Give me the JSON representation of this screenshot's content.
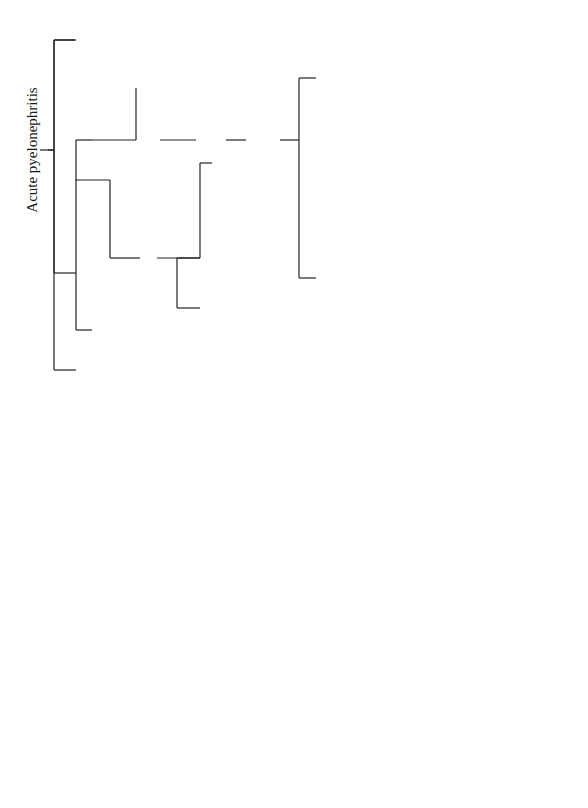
{
  "diagram": {
    "type": "flowchart",
    "orientation": "rotated-90-ccw",
    "title": "Acute pyelonephritis",
    "nodes": {
      "root": "Acute pyelonephritis",
      "uncomplicated": "Uncomplicated",
      "complicated": "Complicated",
      "complicated_criteria": [
        "Hx of structural abnormalities",
        "Hx of resistance to antibiotics",
        "Immunosuppression"
      ],
      "mild_illness": [
        "Mild illness",
        "Tolerating orals"
      ],
      "high_risk": [
        "> 65 yr old",
        "DM",
        "Severe illness",
        "Not taking orals",
        "Sepsis"
      ],
      "severe_sepsis": "Severe illness/sepsis",
      "mild_moderate": [
        "Mild to moderate",
        "illness"
      ],
      "urine_culture_left": "Urine culture",
      "urine_culture_right": "Urine culture",
      "empiric_oral_uncomp": [
        "Empiric Tx",
        "orally for 14 d;",
        "adjust Rx based on",
        "culture results"
      ],
      "empiric_oral_comp": [
        "Empiric treatment",
        "orally for 14 d",
        "(quinolones);",
        "adjust treatment",
        "based on culture",
        "results"
      ],
      "hospitalize": "Hospitalize",
      "urine_blood_culture": "Urine/blood culture",
      "empiric_iv": [
        "Empiric IV antibiotic;",
        "adjust Rx based",
        "on culture results"
      ],
      "response": [
        "Response to Tx",
        "Afebrile after 72 h"
      ],
      "complete_treatment": [
        "Complete treatment",
        "with oral antibiotics",
        "(total = 14 d)"
      ],
      "imaging": [
        "UTZ / CT (R/O",
        "abscess, stone,",
        "obstruction)"
      ],
      "consider_urologic_eval": [
        "Consider urologic",
        "evaluation"
      ],
      "improvement": "Improvement",
      "relapse": [
        "Relapse",
        "(< 2 wks)"
      ],
      "relapse_actions": [
        "Repeat culture",
        "Treat based on culture results",
        "Consider renal UTZ or CT"
      ],
      "reculture": [
        "Reculture",
        "1–2 wk"
      ],
      "resolution": "Resolution",
      "no_resolution_actions": [
        "Consider urologic evaluation",
        "Retreatment with oral antibiotics (based on sensitivities) for 2–6 wk"
      ]
    },
    "edge_labels": {
      "yes": "Yes",
      "no": "No"
    }
  }
}
